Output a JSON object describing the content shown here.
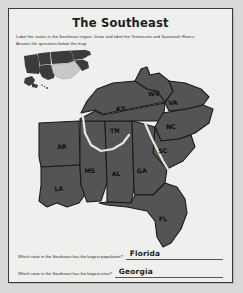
{
  "worksheet": {
    "title": "The Southeast",
    "instructions": [
      "Label the states in the Southeast region. Draw and label the Tennessee and Savannah Rivers.",
      "Answer the questions below the map."
    ]
  },
  "colors": {
    "page_background": "#d9d9d7",
    "sheet_background": "#efefed",
    "sheet_border": "#3a3a3a",
    "map_fill": "#545454",
    "map_outline": "#1a1a1a",
    "inset_fill": "#3b3b3b",
    "inset_highlight": "#c9c9c7",
    "river_stroke": "#e6e6e2",
    "label_text": "#0e0e0e",
    "answer_text": "#1a1a1a"
  },
  "inset_map": {
    "name": "united-states-inset",
    "highlight_region": "Southeast"
  },
  "map": {
    "name": "southeast-region-map",
    "state_labels": [
      {
        "abbr": "AR",
        "x": 45,
        "y": 88
      },
      {
        "abbr": "LA",
        "x": 42,
        "y": 130
      },
      {
        "abbr": "MS",
        "x": 73,
        "y": 112
      },
      {
        "abbr": "AL",
        "x": 99,
        "y": 115
      },
      {
        "abbr": "TN",
        "x": 98,
        "y": 72
      },
      {
        "abbr": "KY",
        "x": 104,
        "y": 50
      },
      {
        "abbr": "WV",
        "x": 137,
        "y": 35
      },
      {
        "abbr": "VA",
        "x": 156,
        "y": 44
      },
      {
        "abbr": "NC",
        "x": 154,
        "y": 68
      },
      {
        "abbr": "SC",
        "x": 146,
        "y": 92
      },
      {
        "abbr": "GA",
        "x": 125,
        "y": 112
      },
      {
        "abbr": "FL",
        "x": 146,
        "y": 160
      }
    ],
    "rivers": [
      {
        "name": "Tennessee River"
      },
      {
        "name": "Savannah River"
      }
    ]
  },
  "questions": [
    {
      "prompt": "Which state in the Southeast has the largest population?",
      "answer": "Florida"
    },
    {
      "prompt": "Which state in the Southeast has the largest area?",
      "answer": "Georgia"
    }
  ]
}
